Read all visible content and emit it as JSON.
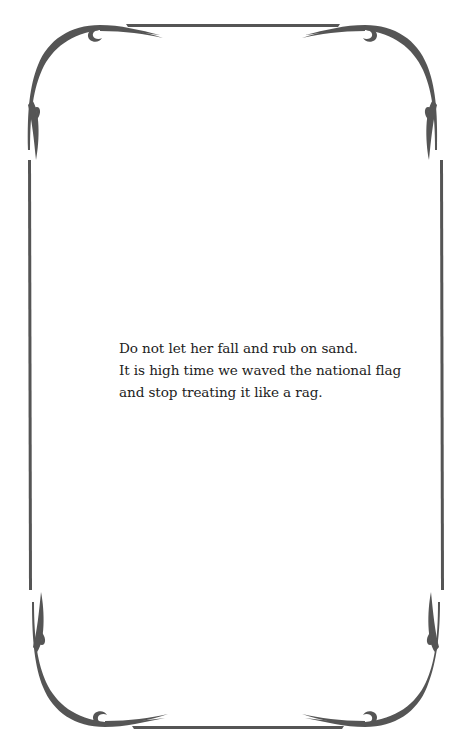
{
  "page": {
    "background": "#ffffff",
    "frame_color": "#555555",
    "text_color": "#222222"
  },
  "frame": {
    "style": "ornamental-border",
    "corners": [
      "top-left-flourish",
      "top-right-flourish",
      "bottom-left-flourish",
      "bottom-right-flourish"
    ]
  },
  "poem": {
    "lines": [
      "Do not let her fall and rub on sand.",
      "It is high time we waved the national flag",
      "and stop treating it like a rag."
    ]
  }
}
